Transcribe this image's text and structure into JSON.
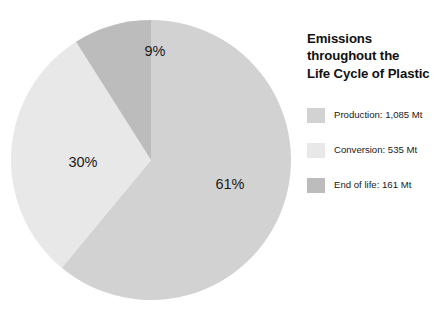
{
  "title": "Emissions\nthroughout the\nLife Cycle of Plastic",
  "chart_data": {
    "type": "pie",
    "title": "Emissions throughout the Life Cycle of Plastic",
    "unit": "Mt",
    "total_value": 1781,
    "start_angle_deg": 0,
    "direction": "clockwise",
    "legend_position": "right",
    "grid": false,
    "categories": [
      "Production",
      "Conversion",
      "End of life"
    ],
    "values": [
      1085,
      535,
      161
    ],
    "percentages": [
      61,
      30,
      9
    ],
    "colors": [
      "#d2d2d2",
      "#e8e8e8",
      "#bcbcbc"
    ],
    "slices": [
      {
        "label": "Production",
        "value": 1085,
        "value_text": "1,085 Mt",
        "percent": 61,
        "percent_text": "61%",
        "color": "#d2d2d2",
        "legend_text": "Production: 1,085 Mt",
        "start_deg": 0,
        "end_deg": 219.6,
        "label_x": 230,
        "label_y": 185
      },
      {
        "label": "Conversion",
        "value": 535,
        "value_text": "535 Mt",
        "percent": 30,
        "percent_text": "30%",
        "color": "#e8e8e8",
        "legend_text": "Conversion: 535 Mt",
        "start_deg": 219.6,
        "end_deg": 327.6,
        "label_x": 83,
        "label_y": 163
      },
      {
        "label": "End of life",
        "value": 161,
        "value_text": "161 Mt",
        "percent": 9,
        "percent_text": "9%",
        "color": "#bcbcbc",
        "legend_text": "End of life: 161 Mt",
        "start_deg": 327.6,
        "end_deg": 360,
        "label_x": 155,
        "label_y": 52
      }
    ],
    "geometry": {
      "center_x": 151,
      "center_y": 160,
      "radius": 140
    }
  },
  "legend": {
    "items": [
      {
        "label": "Production: 1,085 Mt",
        "color": "#d2d2d2"
      },
      {
        "label": "Conversion: 535 Mt",
        "color": "#e8e8e8"
      },
      {
        "label": "End of life: 161 Mt",
        "color": "#bcbcbc"
      }
    ]
  }
}
